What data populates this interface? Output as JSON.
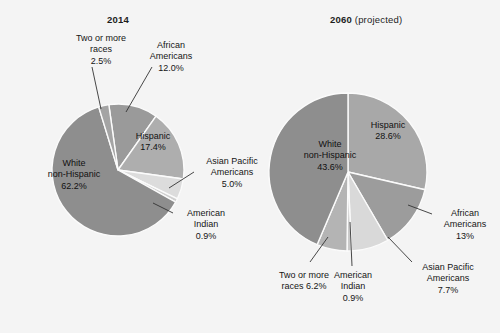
{
  "figure": {
    "background": "#f4f4f4",
    "text_color": "#151515",
    "separator_color": "#fbfbfb"
  },
  "charts": [
    {
      "id": "chart-2014",
      "title_main": "2014",
      "title_sub": "",
      "title_x": 107,
      "title_y": 14,
      "cx": 118,
      "cy": 170,
      "r": 66,
      "start_angle": -8,
      "labels": [
        {
          "name": "two-or-more-races",
          "text": "Two or more\nraces\n2.5%",
          "x": 62,
          "y": 33,
          "w": 78,
          "inside": false
        },
        {
          "name": "african-americans",
          "text": "African\nAmericans\n12.0%",
          "x": 140,
          "y": 40,
          "w": 62,
          "inside": false
        },
        {
          "name": "hispanic",
          "text": "Hispanic\n17.4%",
          "x": 125,
          "y": 131,
          "w": 56,
          "inside": true
        },
        {
          "name": "asian-pacific-americans",
          "text": "Asian Pacific\nAmericans\n5.0%",
          "x": 196,
          "y": 156,
          "w": 72,
          "inside": false
        },
        {
          "name": "american-indian",
          "text": "American\nIndian\n0.9%",
          "x": 175,
          "y": 208,
          "w": 62,
          "inside": false
        },
        {
          "name": "white-non-hispanic",
          "text": "White\nnon-Hispanic\n62.2%",
          "x": 36,
          "y": 158,
          "w": 76,
          "inside": true
        }
      ],
      "leaders": [
        {
          "name": "leader-two-or-more-races",
          "x1": 92,
          "y1": 67,
          "x2": 101,
          "y2": 109
        },
        {
          "name": "leader-african-americans",
          "x1": 152,
          "y1": 67,
          "x2": 126,
          "y2": 112
        },
        {
          "name": "leader-asian-pacific",
          "x1": 194,
          "y1": 172,
          "x2": 169,
          "y2": 188
        },
        {
          "name": "leader-american-indian",
          "x1": 173,
          "y1": 213,
          "x2": 153,
          "y2": 203
        }
      ]
    },
    {
      "id": "chart-2060",
      "title_main": "2060",
      "title_sub": " (projected)",
      "title_x": 330,
      "title_y": 14,
      "cx": 348,
      "cy": 172,
      "r": 79,
      "start_angle": 0,
      "labels": [
        {
          "name": "hispanic",
          "text": "Hispanic\n28.6%",
          "x": 358,
          "y": 120,
          "w": 60,
          "inside": true
        },
        {
          "name": "african-americans",
          "text": "African\nAmericans\n13%",
          "x": 434,
          "y": 208,
          "w": 62,
          "inside": false
        },
        {
          "name": "asian-pacific-americans",
          "text": "Asian Pacific\nAmericans\n7.7%",
          "x": 410,
          "y": 262,
          "w": 76,
          "inside": false
        },
        {
          "name": "american-indian",
          "text": "American\nIndian\n0.9%",
          "x": 322,
          "y": 270,
          "w": 62,
          "inside": false
        },
        {
          "name": "two-or-more-races",
          "text": "Two or more\nraces 6.2%",
          "x": 266,
          "y": 270,
          "w": 76,
          "inside": false
        },
        {
          "name": "white-non-hispanic",
          "text": "White\nnon-Hispanic\n43.6%",
          "x": 290,
          "y": 139,
          "w": 80,
          "inside": true
        }
      ],
      "leaders": [
        {
          "name": "leader-african-americans",
          "x1": 432,
          "y1": 214,
          "x2": 408,
          "y2": 205
        },
        {
          "name": "leader-asian-pacific",
          "x1": 412,
          "y1": 262,
          "x2": 388,
          "y2": 237
        },
        {
          "name": "leader-american-indian",
          "x1": 352,
          "y1": 266,
          "x2": 350,
          "y2": 222
        },
        {
          "name": "leader-two-or-more-races",
          "x1": 310,
          "y1": 262,
          "x2": 328,
          "y2": 237
        }
      ]
    }
  ],
  "chart_data": [
    {
      "type": "pie",
      "title": "2014",
      "id": "chart-2014",
      "unit": "percent of U.S. population",
      "start_angle_deg_from_12oclock": -8,
      "direction": "clockwise",
      "categories": [
        "African Americans",
        "Hispanic",
        "Asian Pacific Americans",
        "American Indian",
        "White non-Hispanic",
        "Two or more races"
      ],
      "values": [
        12.0,
        17.4,
        5.0,
        0.9,
        62.2,
        2.5
      ],
      "labels_shown": [
        "12.0%",
        "17.4%",
        "5.0%",
        "0.9%",
        "62.2%",
        "2.5%"
      ],
      "colors": [
        "#9a9a9a",
        "#aeaeae",
        "#dcdcdc",
        "#cfcfcf",
        "#8e8e8e",
        "#a4a4a4"
      ],
      "legend": "none (direct labels)",
      "grid": false
    },
    {
      "type": "pie",
      "title": "2060 (projected)",
      "id": "chart-2060",
      "unit": "percent of U.S. population",
      "start_angle_deg_from_12oclock": 0,
      "direction": "clockwise",
      "categories": [
        "Hispanic",
        "African Americans",
        "Asian Pacific Americans",
        "American Indian",
        "Two or more races",
        "White non-Hispanic"
      ],
      "values": [
        28.6,
        13.0,
        7.7,
        0.9,
        6.2,
        43.6
      ],
      "labels_shown": [
        "28.6%",
        "13%",
        "7.7%",
        "0.9%",
        "6.2%",
        "43.6%"
      ],
      "colors": [
        "#a8a8a8",
        "#9c9c9c",
        "#d9d9d9",
        "#cacaca",
        "#b4b4b4",
        "#8e8e8e"
      ],
      "legend": "none (direct labels)",
      "grid": false
    }
  ]
}
